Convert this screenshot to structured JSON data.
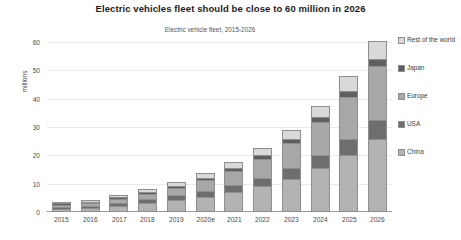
{
  "chart_data": {
    "type": "bar",
    "stacked": true,
    "title": "Electric vehicles fleet should be close to 60 million in 2026",
    "subtitle": "Electric vehicle fleet, 2015-2026",
    "xlabel": "",
    "ylabel": "millions",
    "ylim": [
      0,
      60
    ],
    "yticks": [
      0,
      10,
      20,
      30,
      40,
      50,
      60
    ],
    "grid": true,
    "legend_position": "right",
    "categories": [
      "2015",
      "2016",
      "2017",
      "2018",
      "2019",
      "2020e",
      "2021",
      "2022",
      "2023",
      "2024",
      "2025",
      "2026"
    ],
    "series": [
      {
        "name": "China",
        "color": "#b3b3b3",
        "values": [
          0.4,
          0.7,
          1.4,
          2.4,
          3.4,
          4.6,
          6.2,
          8.3,
          11.0,
          15.0,
          19.5,
          25.0
        ]
      },
      {
        "name": "USA",
        "color": "#6e6e6e",
        "values": [
          0.4,
          0.5,
          0.8,
          1.1,
          1.5,
          1.9,
          2.3,
          2.8,
          3.4,
          4.2,
          5.2,
          6.5
        ]
      },
      {
        "name": "Europe",
        "color": "#a8a8a8",
        "values": [
          0.3,
          0.5,
          0.9,
          1.4,
          2.2,
          3.3,
          4.6,
          6.3,
          8.4,
          11.0,
          14.5,
          18.5
        ]
      },
      {
        "name": "Japan",
        "color": "#5f5f5f",
        "values": [
          0.1,
          0.2,
          0.3,
          0.4,
          0.5,
          0.6,
          0.8,
          1.0,
          1.2,
          1.5,
          1.9,
          2.4
        ]
      },
      {
        "name": "Rest of the world",
        "color": "#d9d9d9",
        "values": [
          0.2,
          0.3,
          0.4,
          0.6,
          0.8,
          1.1,
          1.5,
          2.0,
          2.7,
          3.5,
          4.7,
          6.0
        ]
      }
    ],
    "totals": [
      1.4,
      2.2,
      3.8,
      5.9,
      8.4,
      11.5,
      15.4,
      20.4,
      26.7,
      35.2,
      45.8,
      58.4
    ]
  }
}
